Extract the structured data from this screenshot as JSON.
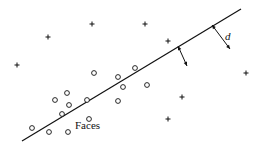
{
  "diagram": {
    "title": "",
    "labels": {
      "faces": "Faces",
      "distance": "d"
    },
    "separator_line": {
      "x1": 22,
      "y1": 141,
      "x2": 241,
      "y2": 9
    },
    "distance_arrows": [
      {
        "x1": 178,
        "y1": 46,
        "x2": 187,
        "y2": 66
      },
      {
        "x1": 212,
        "y1": 25,
        "x2": 230,
        "y2": 49
      }
    ],
    "nonface_points": [
      [
        17,
        65
      ],
      [
        48,
        37
      ],
      [
        92,
        24
      ],
      [
        145,
        24
      ],
      [
        168,
        41
      ],
      [
        246,
        73
      ],
      [
        182,
        97
      ],
      [
        168,
        119
      ]
    ],
    "face_points": [
      [
        94,
        73
      ],
      [
        118,
        77
      ],
      [
        135,
        68
      ],
      [
        123,
        87
      ],
      [
        147,
        85
      ],
      [
        118,
        101
      ],
      [
        89,
        119
      ],
      [
        67,
        93
      ],
      [
        55,
        100
      ],
      [
        69,
        105
      ],
      [
        87,
        100
      ],
      [
        62,
        114
      ],
      [
        32,
        128
      ],
      [
        49,
        132
      ],
      [
        68,
        132
      ]
    ],
    "colors": {
      "ink": "#111111",
      "background": "#ffffff"
    }
  }
}
